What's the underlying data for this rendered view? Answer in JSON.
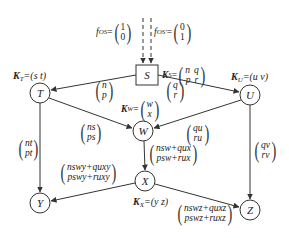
{
  "diagram": {
    "inputs": [
      {
        "label": "f",
        "sub": "OS",
        "eq": "=",
        "vector": [
          "1",
          "0"
        ]
      },
      {
        "label": "f",
        "sub": "OS'",
        "eq": "=",
        "vector": [
          "0",
          "1"
        ]
      }
    ],
    "nodes": {
      "S": {
        "label": "S",
        "shape": "square",
        "k_label": "K",
        "k_sub": "S",
        "k_eq": "=",
        "k_matrix": [
          [
            "n",
            "q"
          ],
          [
            "p",
            "r"
          ]
        ]
      },
      "T": {
        "label": "T",
        "shape": "circle",
        "k_label": "K",
        "k_sub": "T",
        "k_eq": "=(s  t)"
      },
      "U": {
        "label": "U",
        "shape": "circle",
        "k_label": "K",
        "k_sub": "U",
        "k_eq": "=(u  v)"
      },
      "W": {
        "label": "W",
        "shape": "circle",
        "k_label": "K",
        "k_sub": "W",
        "k_eq": "=",
        "k_vector": [
          "w",
          "x"
        ]
      },
      "X": {
        "label": "X",
        "shape": "circle",
        "k_label": "K",
        "k_sub": "X",
        "k_eq": "=(y  z)"
      },
      "Y": {
        "label": "Y",
        "shape": "circle"
      },
      "Z": {
        "label": "Z",
        "shape": "circle"
      }
    },
    "edges": [
      {
        "from": "S",
        "to": "T",
        "vector": [
          "n",
          "p"
        ]
      },
      {
        "from": "S",
        "to": "U",
        "vector": [
          "q",
          "r"
        ]
      },
      {
        "from": "T",
        "to": "W",
        "vector": [
          "ns",
          "ps"
        ]
      },
      {
        "from": "U",
        "to": "W",
        "vector": [
          "qu",
          "ru"
        ]
      },
      {
        "from": "T",
        "to": "Y",
        "vector": [
          "nt",
          "pt"
        ]
      },
      {
        "from": "U",
        "to": "Z",
        "vector": [
          "qv",
          "rv"
        ]
      },
      {
        "from": "W",
        "to": "X",
        "vector": [
          "nsw+qux",
          "psw+rux"
        ]
      },
      {
        "from": "X",
        "to": "Y",
        "vector": [
          "nswy+quxy",
          "pswy+ruxy"
        ]
      },
      {
        "from": "X",
        "to": "Z",
        "vector": [
          "nswz+quxz",
          "pswz+ruxz"
        ]
      }
    ],
    "colors": {
      "stroke": "#333333",
      "background": "#ffffff"
    }
  }
}
